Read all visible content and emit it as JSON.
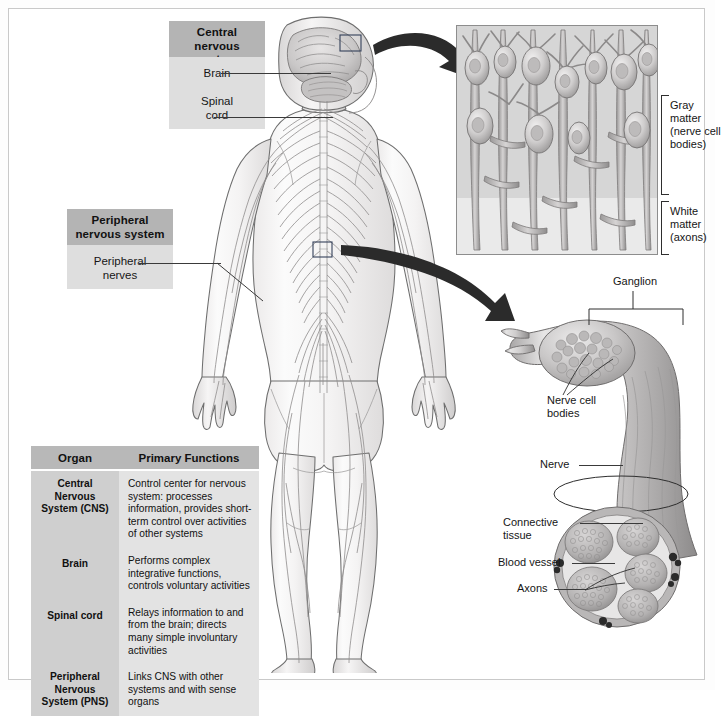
{
  "figure": {
    "background_color": "#ffffff",
    "border_color": "#c9c9c9",
    "header_box_color": "#b4b4b4",
    "sub_box_color": "#dedede",
    "ink_color": "#2e2e2e"
  },
  "labels": {
    "cns_header": "Central\nnervous system",
    "cns_header_line1": "Central",
    "cns_header_line2": "nervous system",
    "brain": "Brain",
    "spinal_cord_line1": "Spinal",
    "spinal_cord_line2": "cord",
    "pns_header_line1": "Peripheral",
    "pns_header_line2": "nervous system",
    "peripheral_nerves_line1": "Peripheral",
    "peripheral_nerves_line2": "nerves",
    "gray_matter_line1": "Gray",
    "gray_matter_line2": "matter",
    "gray_matter_line3": "(nerve cell",
    "gray_matter_line4": "bodies)",
    "white_matter_line1": "White",
    "white_matter_line2": "matter",
    "white_matter_line3": "(axons)",
    "ganglion": "Ganglion",
    "nerve_cell_bodies_line1": "Nerve cell",
    "nerve_cell_bodies_line2": "bodies",
    "nerve": "Nerve",
    "connective_tissue_line1": "Connective",
    "connective_tissue_line2": "tissue",
    "blood_vessel": "Blood vessel",
    "axons": "Axons"
  },
  "table": {
    "headers": [
      "Organ",
      "Primary Functions"
    ],
    "rows": [
      {
        "organ": "Central\nNervous\nSystem (CNS)",
        "organ_line1": "Central",
        "organ_line2": "Nervous",
        "organ_line3": "System (CNS)",
        "functions": "Control center for nervous system: processes information, provides short-term control over activities of other systems"
      },
      {
        "organ": "Brain",
        "organ_line1": "Brain",
        "organ_line2": "",
        "organ_line3": "",
        "functions": "Performs complex integrative functions, controls voluntary activities"
      },
      {
        "organ": "Spinal cord",
        "organ_line1": "Spinal cord",
        "organ_line2": "",
        "organ_line3": "",
        "functions": "Relays information to and from the brain; directs many simple involuntary activities"
      },
      {
        "organ": "Peripheral\nNervous\nSystem (PNS)",
        "organ_line1": "Peripheral",
        "organ_line2": "Nervous",
        "organ_line3": "System (PNS)",
        "functions": "Links CNS with other systems and with sense organs"
      }
    ]
  }
}
